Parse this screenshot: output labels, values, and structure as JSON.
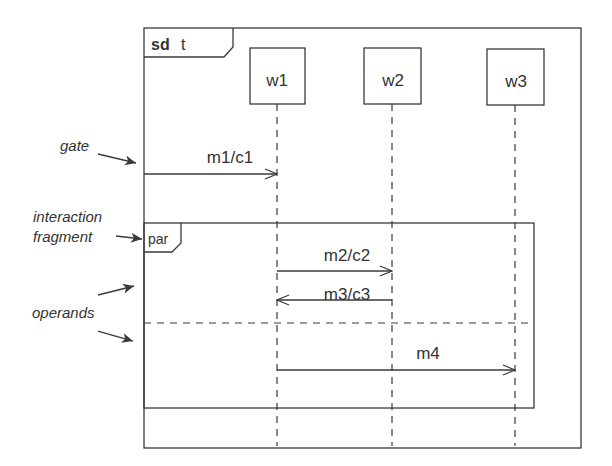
{
  "diagram": {
    "type": "UML sequence diagram",
    "frame": {
      "keyword": "sd",
      "name": "t"
    },
    "lifelines": [
      {
        "id": "w1",
        "label": "w1"
      },
      {
        "id": "w2",
        "label": "w2"
      },
      {
        "id": "w3",
        "label": "w3"
      }
    ],
    "messages": [
      {
        "label": "m1/c1",
        "from": "gate",
        "to": "w1"
      },
      {
        "label": "m2/c2",
        "from": "w1",
        "to": "w2"
      },
      {
        "label": "m3/c3",
        "from": "w2",
        "to": "w1"
      },
      {
        "label": "m4",
        "from": "w1",
        "to": "w3"
      }
    ],
    "fragment": {
      "operator": "par",
      "operands": 2
    },
    "annotations": {
      "gate": "gate",
      "fragment_line1": "interaction",
      "fragment_line2": "fragment",
      "operands": "operands"
    }
  }
}
